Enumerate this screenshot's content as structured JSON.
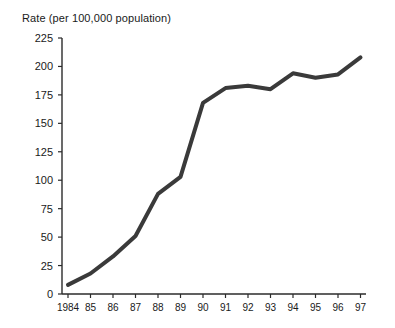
{
  "chart_data": {
    "type": "line",
    "title": "Rate (per 100,000 population)",
    "xlabel": "",
    "ylabel": "",
    "categories": [
      "1984",
      "85",
      "86",
      "87",
      "88",
      "89",
      "90",
      "91",
      "92",
      "93",
      "94",
      "95",
      "96",
      "97"
    ],
    "values": [
      8,
      18,
      33,
      51,
      88,
      103,
      168,
      181,
      183,
      180,
      194,
      190,
      193,
      208
    ],
    "series": [
      {
        "name": "Rate",
        "values": [
          8,
          18,
          33,
          51,
          88,
          103,
          168,
          181,
          183,
          180,
          194,
          190,
          193,
          208
        ]
      }
    ],
    "ylim": [
      0,
      225
    ],
    "yticks": [
      0,
      25,
      50,
      75,
      100,
      125,
      150,
      175,
      200,
      225
    ],
    "ytick_labels": [
      "0",
      "25",
      "50",
      "75",
      "100",
      "125",
      "150",
      "175",
      "200",
      "225"
    ],
    "grid": false,
    "legend": false,
    "legend_position": "none",
    "line_color": "#3a3a3a",
    "axis_color": "#2b2b2b",
    "background_color": "#ffffff"
  }
}
